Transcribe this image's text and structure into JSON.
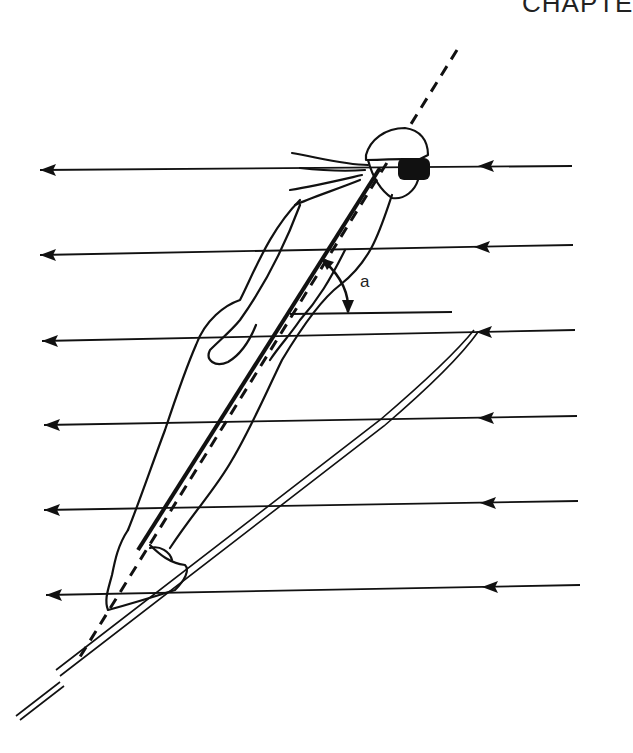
{
  "page_header": {
    "text": "CHAPTE"
  },
  "figure": {
    "angle_label": "a",
    "ink_color": "#111111",
    "background": "#ffffff",
    "flow_lines": [
      {
        "y": 168,
        "x_start": 40,
        "x_end": 572,
        "arrow_right_x": 478
      },
      {
        "y": 254,
        "x_start": 40,
        "x_end": 573,
        "arrow_right_x": 478
      },
      {
        "y": 340,
        "x_start": 42,
        "x_end": 575,
        "arrow_right_x": 482
      },
      {
        "y": 424,
        "x_start": 44,
        "x_end": 577,
        "arrow_right_x": 484
      },
      {
        "y": 509,
        "x_start": 44,
        "x_end": 578,
        "arrow_right_x": 486
      },
      {
        "y": 594,
        "x_start": 46,
        "x_end": 580,
        "arrow_right_x": 488
      }
    ],
    "reference_line": {
      "y": 313,
      "x_start": 290,
      "x_end": 452
    }
  }
}
